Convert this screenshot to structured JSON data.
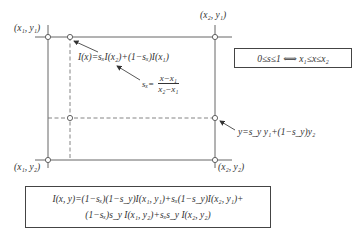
{
  "diagram": {
    "corners": {
      "top_left": "(x₁, y₁)",
      "top_right": "(x₂, y₁)",
      "bottom_left": "(x₁, y₂)",
      "bottom_right": "(x₂, y₂)"
    },
    "annotations": {
      "interp_x": "I(x)=sₓI(x₂)+(1−sₓ)I(x₁)",
      "sx_lhs": "sₓ=",
      "sx_numerator": "x−x₁",
      "sx_denominator": "x₂−x₁",
      "interp_y": "y=s_y y₁+(1−s_y)y₂"
    },
    "condition_box": "0≤s≤1 ⟺ x₁≤x≤x₂",
    "formula_box": {
      "line1": "I(x, y)=(1−sₓ)(1−s_y)I(x₁, y₁)+sₓ(1−s_y)I(x₂, y₁)+",
      "line2": "(1−sₓ)s_y I(x₁, y₂)+sₓs_y I(x₂, y₂)"
    },
    "colors": {
      "line": "#555555",
      "text": "#333333",
      "background": "#ffffff"
    }
  }
}
